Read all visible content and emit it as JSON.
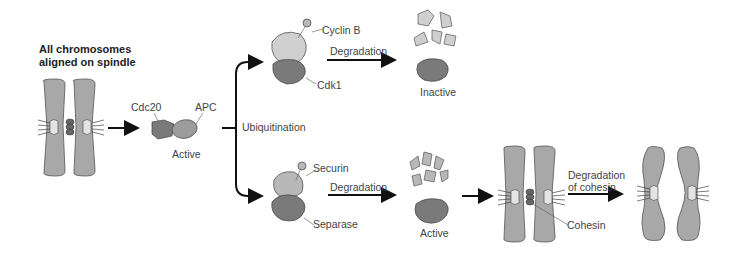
{
  "title": {
    "line1": "All chromosomes",
    "line2": "aligned on spindle"
  },
  "apc_complex": {
    "cdc20": "Cdc20",
    "apc": "APC",
    "state": "Active"
  },
  "branch_label": "Ubiquitination",
  "top_path": {
    "cyclin": "Cyclin B",
    "cdk": "Cdk1",
    "arrow": "Degradation",
    "result_state": "Inactive"
  },
  "bottom_path": {
    "securin": "Securin",
    "separase": "Separase",
    "arrow": "Degradation",
    "result_state": "Active"
  },
  "cohesin_step": {
    "cohesin": "Cohesin",
    "arrow_line1": "Degradation",
    "arrow_line2": "of cohesin"
  },
  "colors": {
    "chromosome": "#a8a8a8",
    "dark_protein": "#7a7a7a",
    "light_protein": "#c8c8c8",
    "arrow": "#111111"
  }
}
